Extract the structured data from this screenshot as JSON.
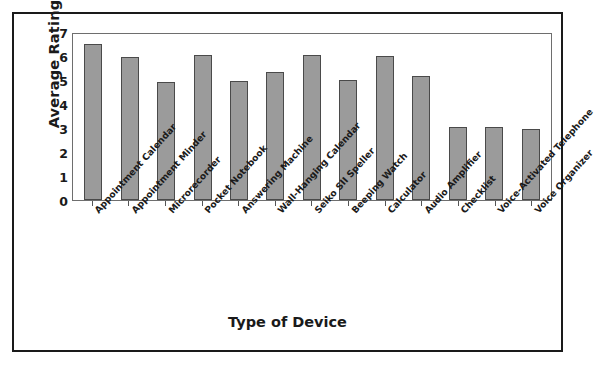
{
  "chart_data": {
    "type": "bar",
    "title": "",
    "xlabel": "Type of Device",
    "ylabel": "Average Rating",
    "ylim": [
      0,
      7
    ],
    "yticks": [
      "7",
      "6",
      "5",
      "4",
      "3",
      "2",
      "1",
      "0"
    ],
    "grid": false,
    "legend": null,
    "bar_color": "#9b9b9b",
    "bar_border_color": "#4a4a4a",
    "categories": [
      "Appointment Calendar",
      "Appointment Minder",
      "Microrecorder",
      "Pocket Notebook",
      "Answering Machine",
      "Wall-Hanging Calendar",
      "Seiko SII Speller",
      "Beeping Watch",
      "Calculator",
      "Audio Amplifier",
      "Checklist",
      "Voice-Activated Telephone",
      "Voice Organizer"
    ],
    "values": [
      6.5,
      5.95,
      4.9,
      6.05,
      4.95,
      5.35,
      6.05,
      5.0,
      6.0,
      5.15,
      3.05,
      3.05,
      2.95
    ]
  }
}
